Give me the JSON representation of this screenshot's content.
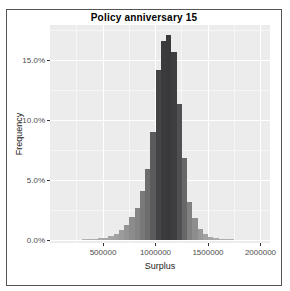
{
  "chart_data": {
    "type": "bar",
    "subtype": "histogram",
    "title": "Policy anniversary 15",
    "xlabel": "Surplus",
    "ylabel": "Frequency",
    "legend": "none",
    "grid": "on",
    "x_axis": {
      "tick_values": [
        500000,
        1000000,
        1500000,
        2000000
      ],
      "tick_labels": [
        "500000",
        "1000000",
        "1500000",
        "2000000"
      ],
      "minor_tick_values": [
        250000,
        750000,
        1250000,
        1750000
      ],
      "range": [
        0,
        2095000
      ]
    },
    "y_axis": {
      "tick_values": [
        0,
        5,
        10,
        15
      ],
      "tick_labels": [
        "0.0%",
        "5.0%",
        "10.0%",
        "15.0%"
      ],
      "minor_tick_values": [
        2.5,
        7.5,
        12.5,
        17.5
      ],
      "range": [
        0,
        17.9
      ],
      "unit": "percent"
    },
    "binwidth": 50000,
    "bins": {
      "start_values": [
        300000,
        350000,
        400000,
        450000,
        500000,
        550000,
        600000,
        650000,
        700000,
        750000,
        800000,
        850000,
        900000,
        950000,
        1000000,
        1050000,
        1100000,
        1150000,
        1200000,
        1250000,
        1300000,
        1350000,
        1400000,
        1450000,
        1500000,
        1550000,
        1600000,
        1650000,
        1700000
      ],
      "height_pct": [
        0.02,
        0.05,
        0.08,
        0.13,
        0.2,
        0.32,
        0.5,
        0.8,
        1.25,
        1.9,
        2.7,
        4.1,
        5.9,
        9.0,
        14.2,
        16.6,
        17.1,
        15.7,
        11.3,
        6.8,
        3.2,
        1.8,
        0.95,
        0.5,
        0.28,
        0.15,
        0.08,
        0.05,
        0.03
      ]
    },
    "style": {
      "panel_bg": "#ececec",
      "gridline_color": "#ffffff",
      "bar_color_min": "#b6b6b6",
      "bar_color_max": "#39393b",
      "border_color": "#555555",
      "tick_color": "#333333",
      "tick_label_color": "#4d4d4d",
      "axis_title_color": "#1a1a1a",
      "title_color": "#000000"
    }
  }
}
